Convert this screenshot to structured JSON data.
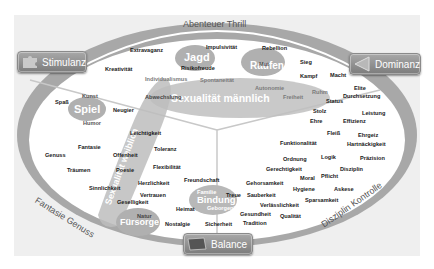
{
  "ring_labels": {
    "top": "Abenteuer Thrill",
    "left": "Fantasie Genuss",
    "right": "Disziplin Kontrolle"
  },
  "buttons": {
    "stimulanz": {
      "label": "Stimulanz",
      "icon": "puzzle-icon"
    },
    "dominanz": {
      "label": "Dominanz",
      "icon": "triangle-left-icon"
    },
    "balance": {
      "label": "Balance",
      "icon": "card-icon"
    }
  },
  "clusters": {
    "jagd": "Jagd",
    "raufen": "Raufen",
    "spiel": "Spiel",
    "sexualitaet_maennlich": "Sexualität männlich",
    "sexualitaet_weiblich": "Sexualität weiblich",
    "fuersorge": "Fürsorge",
    "bindung": "Bindung"
  },
  "words": {
    "extravaganz": "Extravaganz",
    "impulsivitaet": "Impulsivität",
    "rebellion": "Rebellion",
    "kreativitaet": "Kreativität",
    "risikofreude": "Risikofreude",
    "mut": "Mut",
    "sieg": "Sieg",
    "individualismus": "Individualismus",
    "spontaneitaet": "Spontaneität",
    "kampf": "Kampf",
    "macht": "Macht",
    "abwechslung": "Abwechslung",
    "autonomie": "Autonomie",
    "freiheit": "Freiheit",
    "ruhm": "Ruhm",
    "elite": "Elite",
    "status": "Status",
    "durchsetzung": "Durchsetzung",
    "kunst": "Kunst",
    "spass": "Spaß",
    "neugier": "Neugier",
    "humor": "Humor",
    "stolz": "Stolz",
    "leistung": "Leistung",
    "ehre": "Ehre",
    "effizienz": "Effizienz",
    "leichtigkeit": "Leichtigkeit",
    "fleiss": "Fleiß",
    "ehrgeiz": "Ehrgeiz",
    "funktionalitaet": "Funktionalität",
    "hartnaeckigkeit": "Hartnäckigkeit",
    "fantasie": "Fantasie",
    "toleranz": "Toleranz",
    "genuss": "Genuss",
    "offenheit": "Offenheit",
    "ordnung": "Ordnung",
    "logik": "Logik",
    "praezision": "Präzision",
    "traeumen": "Träumen",
    "poesie": "Poesie",
    "flexibilitaet": "Flexibilität",
    "gerechtigkeit": "Gerechtigkeit",
    "disziplin": "Disziplin",
    "moral": "Moral",
    "pflicht": "Pflicht",
    "sinnlichkeit": "Sinnlichkeit",
    "herzlichkeit": "Herzlichkeit",
    "freundschaft": "Freundschaft",
    "gehorsamkeit": "Gehorsamkeit",
    "hygiene": "Hygiene",
    "askese": "Askese",
    "vertrauen": "Vertrauen",
    "familie": "Familie",
    "treue": "Treue",
    "sauberkeit": "Sauberkeit",
    "geselligkeit": "Geselligkeit",
    "sparsamkeit": "Sparsamkeit",
    "heimat": "Heimat",
    "geborgenheit": "Geborgenheit",
    "verlaesslichkeit": "Verlässlichkeit",
    "natur": "Natur",
    "gesundheit": "Gesundheit",
    "qualitaet": "Qualität",
    "nostalgie": "Nostalgie",
    "sicherheit": "Sicherheit",
    "tradition": "Tradition"
  },
  "colors": {
    "ring": "#a6a6a6",
    "panel": "#efefef",
    "blob": "#b5b5b5",
    "button": "#8f8f8f"
  }
}
